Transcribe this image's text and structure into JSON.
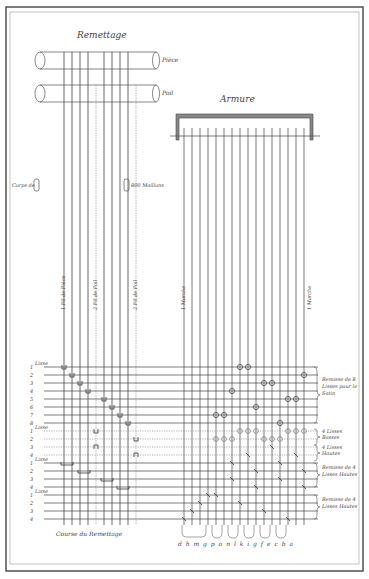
{
  "titles": {
    "remettage": "Remettage",
    "armure": "Armure",
    "course": "Course du Remettage"
  },
  "rollers": [
    {
      "label": "Pièce"
    },
    {
      "label": "Poil"
    }
  ],
  "side_labels": {
    "corps": "Corps de",
    "maillons": "800 Maillons"
  },
  "vertical_labels": {
    "fil_piece_1": "1 Fil de Pièce",
    "fil_poil_1": "2 Fil de Poil",
    "fil_poil_2": "2 Fil de Poil",
    "marche_left": "1 Marche",
    "marche_right": "1 Marche"
  },
  "row_labels": {
    "group1": {
      "header": "Lisse",
      "rows": [
        "1",
        "2",
        "3",
        "4",
        "5",
        "6",
        "7",
        "8"
      ]
    },
    "group2": {
      "header": "Lisse",
      "rows": [
        "1",
        "2",
        "3",
        "4"
      ]
    },
    "group3": {
      "header": "Lisse",
      "rows": [
        "1",
        "2",
        "3",
        "4"
      ]
    },
    "group4": {
      "header": "Lisse",
      "rows": [
        "1",
        "2",
        "3",
        "4"
      ]
    }
  },
  "brace_labels": [
    {
      "text": "Remisse de 8 Lisses pour le Satin"
    },
    {
      "text": "4 Lisses Basses"
    },
    {
      "text": "4 Lisses Hautes"
    },
    {
      "text": "Remisse de 4 Lisses Hautes"
    },
    {
      "text": "Remisse de 4 Lisses Hautes"
    }
  ],
  "treadle_letters": "d h m g p o n l k i g f e c b a",
  "colors": {
    "ink": "#333333",
    "faint": "#888888",
    "frame": "#555555",
    "bar": "#777777"
  }
}
